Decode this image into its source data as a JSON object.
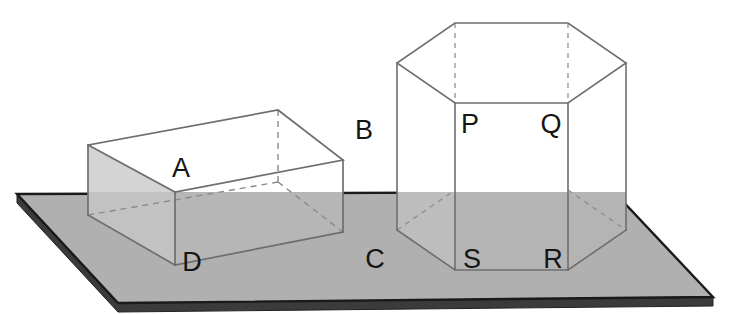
{
  "figure": {
    "canvas": {
      "width": 730,
      "height": 314
    },
    "background_color": "#ffffff",
    "palette": {
      "slab_top": "#b0b0b0",
      "slab_front_edge": "#8f8f8f",
      "slab_bottom_edge": "#3b3b3b",
      "slab_outline": "#1a1a1a",
      "solid_face_light": "#ffffff",
      "solid_face_shadowed": "#cfcfcf",
      "solid_face_behind_slab": "#b8b8b8",
      "edge_line": "#6e6e6e",
      "hidden_edge_line": "#8a8a8a",
      "label_color": "#151515"
    },
    "stroke_widths": {
      "solid_edge": 1.6,
      "hidden_edge": 1.4,
      "slab_outline": 2.6
    },
    "slab": {
      "name": "rectangular-slab",
      "top_face_points": "17,194 198,182 614,192 713,297 118,303",
      "top_face_simple": "17,194 614,192 713,297 118,303",
      "thickness_px": 9,
      "front_face_points": "17,194 17,203 118,312 713,306 713,297 118,303",
      "left_edge_points": "17,194 17,203 118,312 118,303"
    },
    "cuboid": {
      "name": "rectangular-prism-ABCD",
      "vertices": {
        "top_back_left": "88,145",
        "top_back_right": "278,110",
        "top_front_right": "343,160",
        "top_front_left": "175,192",
        "bottom_back_left": "88,215",
        "bottom_back_right": "278,182",
        "bottom_front_right": "343,232",
        "bottom_front_left": "175,265"
      },
      "labels": [
        {
          "id": "A",
          "text": "A",
          "x": 181,
          "y": 177,
          "anchor_vertex": "top_front_left"
        },
        {
          "id": "B",
          "text": "B",
          "x": 364,
          "y": 139,
          "anchor_vertex": "top_front_right"
        },
        {
          "id": "C",
          "text": "C",
          "x": 375,
          "y": 268,
          "anchor_vertex": "bottom_front_right"
        },
        {
          "id": "D",
          "text": "D",
          "x": 192,
          "y": 271,
          "anchor_vertex": "bottom_front_left"
        }
      ]
    },
    "hex_prism": {
      "name": "hexagonal-prism-PQRS",
      "top_face_points": "455,23 568,23 626,63 568,103 455,103 397,63",
      "bottom_face_points": "455,190 568,190 626,230 568,270 455,270 397,230",
      "labels": [
        {
          "id": "P",
          "text": "P",
          "x": 470,
          "y": 133,
          "anchor_vertex": "front_left_upper"
        },
        {
          "id": "Q",
          "text": "Q",
          "x": 551,
          "y": 133,
          "anchor_vertex": "front_right_upper"
        },
        {
          "id": "R",
          "text": "R",
          "x": 553,
          "y": 268,
          "anchor_vertex": "front_right_lower"
        },
        {
          "id": "S",
          "text": "S",
          "x": 472,
          "y": 268,
          "anchor_vertex": "front_left_lower"
        }
      ]
    }
  }
}
